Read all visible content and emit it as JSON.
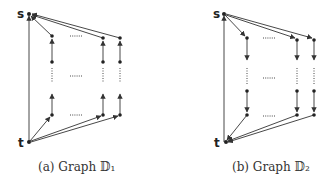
{
  "figure": {
    "subfigures": [
      {
        "id": "a",
        "caption": "(a) Graph 𝔻₁",
        "source_label": "s",
        "sink_label": "t",
        "column_direction": "up",
        "ellipsis": "......"
      },
      {
        "id": "b",
        "caption": "(b) Graph 𝔻₂",
        "source_label": "s",
        "sink_label": "t",
        "column_direction": "down",
        "ellipsis": "......"
      }
    ]
  },
  "colors": {
    "edge": "#333333",
    "node": "#222222",
    "text": "#333333",
    "background": "#ffffff"
  }
}
